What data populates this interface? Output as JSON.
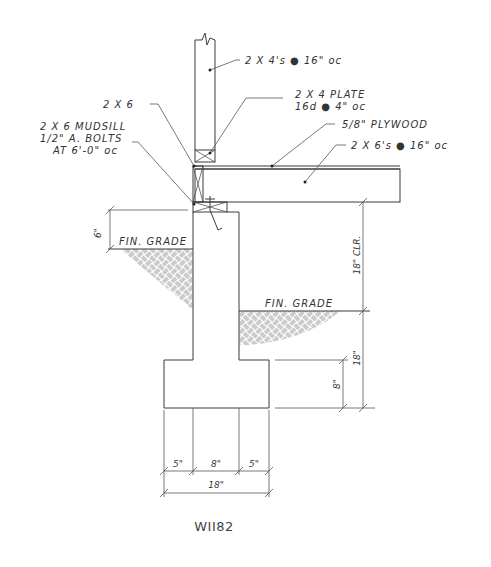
{
  "drawing": {
    "id_label": "WII82",
    "notes": {
      "studs": "2 X 4's ● 16\" oc",
      "plate_line1": "2 X 4 PLATE",
      "plate_line2": "16d ● 4\" oc",
      "plywood": "5/8\" PLYWOOD",
      "joists": "2 X 6's ● 16\" oc",
      "rim": "2 X 6",
      "mudsill_line1": "2 X 6 MUDSILL",
      "mudsill_line2": "1/2\" A. BOLTS",
      "mudsill_line3": "AT 6'-0\" oc",
      "grade_left": "FIN. GRADE",
      "grade_right": "FIN. GRADE"
    },
    "dimensions": {
      "above_grade": "6\"",
      "clearance": "18\" CLR.",
      "depth_below_grade": "18\"",
      "footing_thickness": "8\"",
      "footing_left_projection": "5\"",
      "stem_width": "8\"",
      "footing_right_projection": "5\"",
      "footing_width": "18\""
    },
    "colors": {
      "line": "#3a3a3a",
      "background": "#ffffff"
    }
  }
}
